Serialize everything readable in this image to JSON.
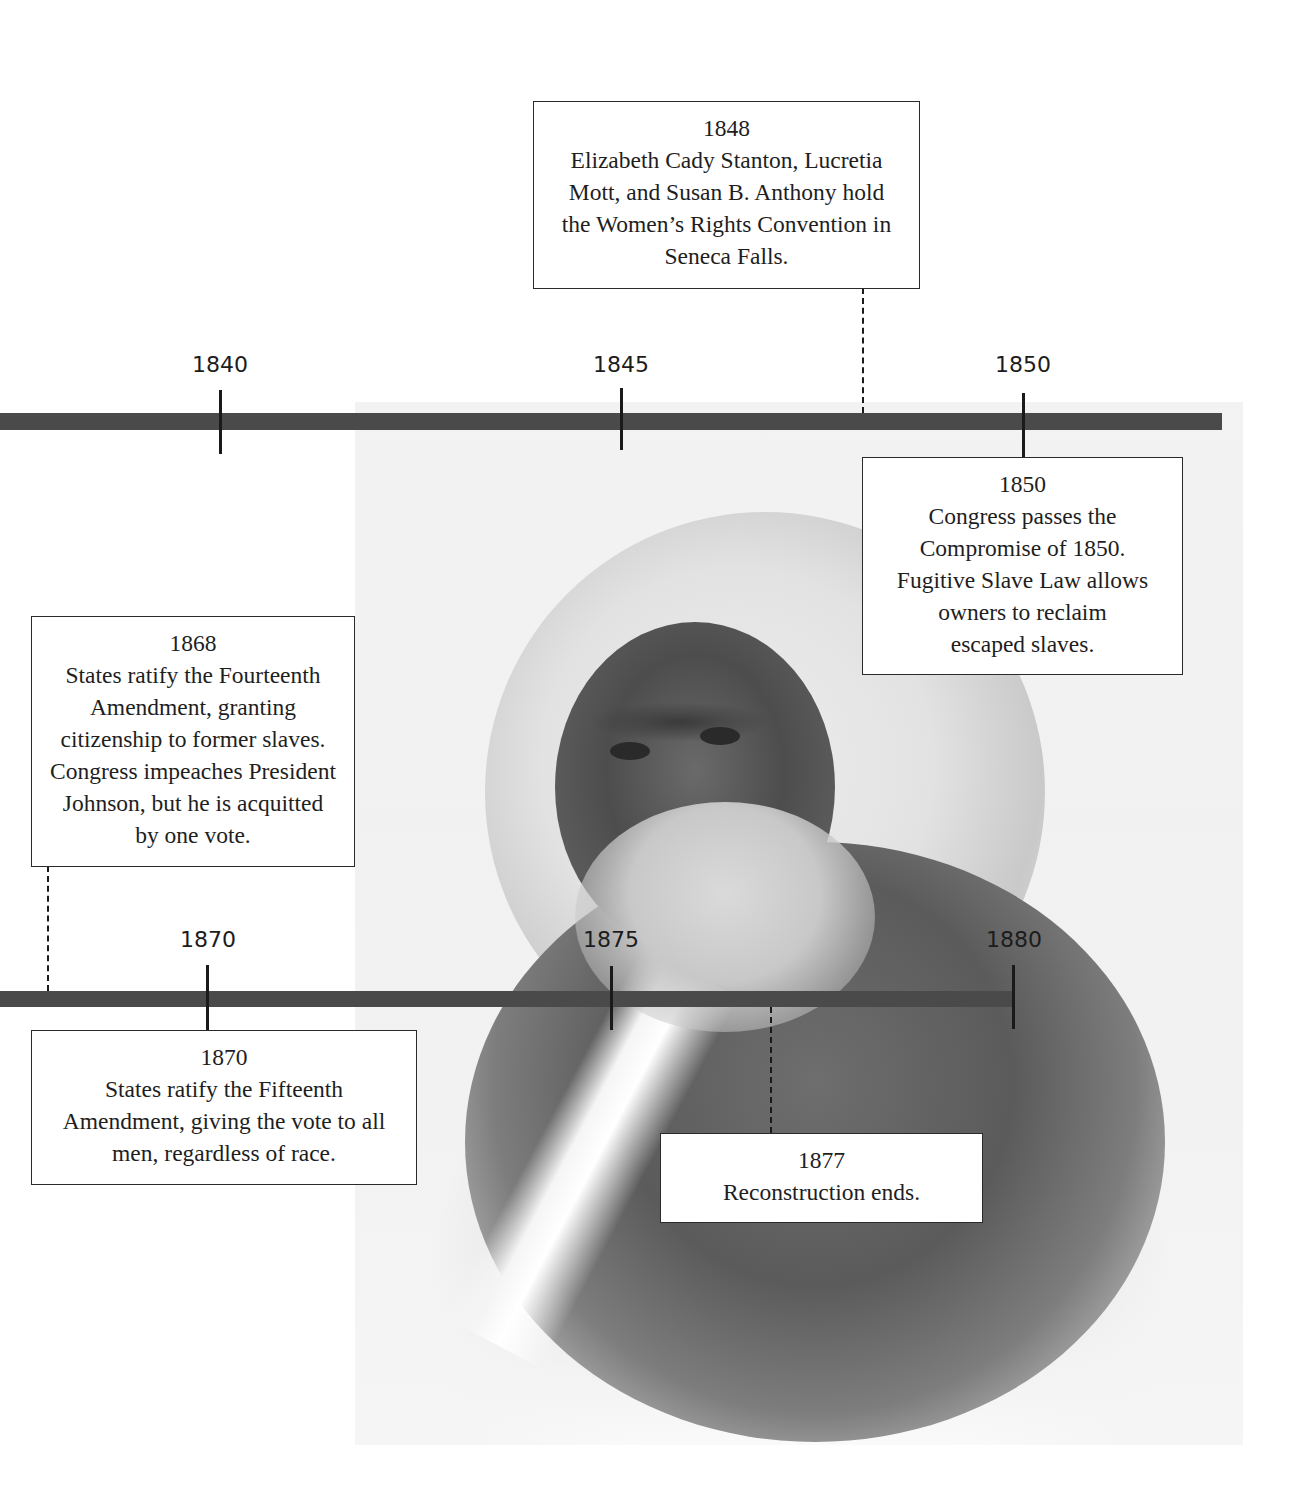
{
  "timeline_top": {
    "ticks": [
      {
        "label": "1840",
        "x": 220
      },
      {
        "label": "1845",
        "x": 621
      },
      {
        "label": "1850",
        "x": 1023
      }
    ]
  },
  "timeline_bottom": {
    "ticks": [
      {
        "label": "1870",
        "x": 207
      },
      {
        "label": "1875",
        "x": 611
      },
      {
        "label": "1880",
        "x": 1013
      }
    ]
  },
  "events": [
    {
      "year": "1848",
      "desc": "Elizabeth Cady Stanton, Lucretia\nMott, and Susan B. Anthony hold\nthe Women’s Rights Convention in\nSeneca Falls."
    },
    {
      "year": "1850",
      "desc": "Congress passes the\nCompromise of 1850.\nFugitive Slave Law allows\nowners to reclaim\nescaped slaves."
    },
    {
      "year": "1868",
      "desc": "States ratify the Fourteenth\nAmendment, granting\ncitizenship to former slaves.\nCongress impeaches President\nJohnson, but he is acquitted\nby one vote."
    },
    {
      "year": "1870",
      "desc": "States ratify the Fifteenth\nAmendment, giving the vote to all\nmen, regardless of race."
    },
    {
      "year": "1877",
      "desc": "Reconstruction ends."
    }
  ],
  "image": {
    "subject": "engraved portrait of a bearded man with white hair in a dark coat"
  }
}
